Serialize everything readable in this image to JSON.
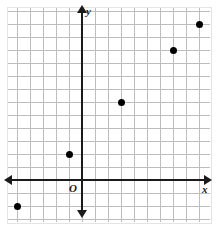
{
  "figure": {
    "kind": "coordinate-plane-scatter-plot",
    "background_color": "#ffffff",
    "grid_color": "#bdbdbd",
    "axis_color": "#1a1a1a",
    "point_color": "#000000"
  },
  "labels": {
    "x_axis": "x",
    "y_axis": "y",
    "origin": "O"
  },
  "chart_data": {
    "type": "scatter",
    "title": "",
    "xlabel": "x",
    "ylabel": "y",
    "origin_label": "O",
    "grid": true,
    "grid_step": 1,
    "legend": null,
    "xlim": [
      -6,
      10
    ],
    "ylim": [
      -3,
      14
    ],
    "tick_labels_shown": false,
    "points": [
      {
        "x": -5,
        "y": -2
      },
      {
        "x": -1,
        "y": 2
      },
      {
        "x": 3,
        "y": 6
      },
      {
        "x": 7,
        "y": 10
      },
      {
        "x": 9,
        "y": 12
      }
    ]
  },
  "render": {
    "pixels_per_unit": 13,
    "origin_px": {
      "x": 82,
      "y": 180
    },
    "grid_box_px": {
      "left": 8,
      "top": 8,
      "width": 202,
      "height": 214
    }
  }
}
